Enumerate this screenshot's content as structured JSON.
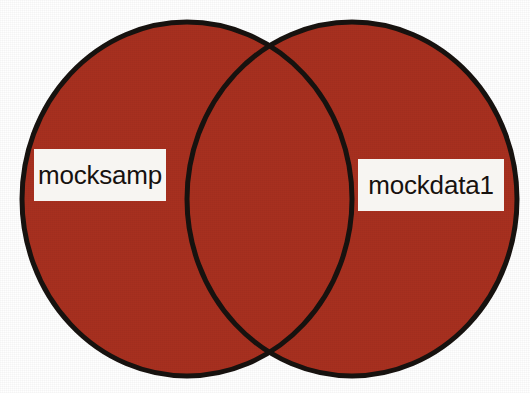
{
  "figure": {
    "type": "venn-diagram",
    "background_color": "#ffffff",
    "set_count": 2
  },
  "chart_data": {
    "type": "venn",
    "title": "",
    "sets": [
      {
        "name": "mocksamp",
        "label": "mocksamp",
        "position": "left",
        "fill_color": "#A8301F",
        "stroke_color": "#17120f"
      },
      {
        "name": "mockdata1",
        "label": "mockdata1",
        "position": "right",
        "fill_color": "#A8301F",
        "stroke_color": "#17120f"
      }
    ],
    "intersection": {
      "label": "",
      "fill_color": "#A8301F",
      "shared": true
    },
    "legend": "none",
    "grid": false
  },
  "shapes": {
    "left_ellipse": {
      "cx": 187,
      "cy": 199,
      "rx": 165,
      "ry": 177
    },
    "right_ellipse": {
      "cx": 352,
      "cy": 199,
      "rx": 165,
      "ry": 177
    },
    "stroke_width": 5
  },
  "labels": {
    "left": {
      "text": "mocksamp",
      "box_color": "#f7f5f2",
      "text_color": "#17120f"
    },
    "right": {
      "text": "mockdata1",
      "box_color": "#f7f5f2",
      "text_color": "#17120f"
    }
  },
  "colors": {
    "fill": "#A8301F",
    "stroke": "#17120f",
    "background": "#ffffff",
    "label_box": "#f7f5f2",
    "label_text": "#17120f"
  }
}
